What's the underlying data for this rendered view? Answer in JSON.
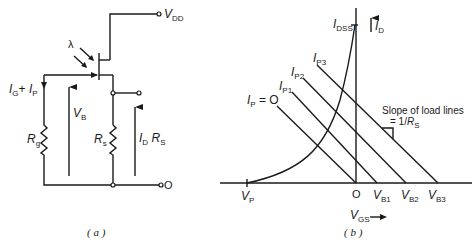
{
  "figure": {
    "panel_a": {
      "caption": "( a )",
      "labels": {
        "vdd": {
          "main": "V",
          "sub": "DD"
        },
        "lambda": "λ",
        "gate_current": {
          "a": "I",
          "a_sub": "G",
          "plus": "+ ",
          "b": "I",
          "b_sub": "P"
        },
        "vb": {
          "main": "V",
          "sub": "B"
        },
        "rg": {
          "main": "R",
          "sub": "g"
        },
        "rs": {
          "main": "R",
          "sub": "s"
        },
        "output_voltage": {
          "a": "I",
          "a_sub": "D",
          "b": " R",
          "b_sub": "S"
        },
        "ground": "O"
      }
    },
    "panel_b": {
      "caption": "( b )",
      "labels": {
        "idss": {
          "main": "I",
          "sub": "DSS"
        },
        "id_axis": {
          "main": "I",
          "sub": "D"
        },
        "vgs_axis": {
          "main": "V",
          "sub": "GS"
        },
        "vp": {
          "main": "V",
          "sub": "P"
        },
        "origin": "O",
        "vb1": {
          "main": "V",
          "sub": "B1"
        },
        "vb2": {
          "main": "V",
          "sub": "B2"
        },
        "vb3": {
          "main": "V",
          "sub": "B3"
        },
        "ip0": {
          "main": "I",
          "sub": "P",
          "suffix": " = O"
        },
        "ip1": {
          "main": "I",
          "sub": "P1"
        },
        "ip2": {
          "main": "I",
          "sub": "P2"
        },
        "ip3": {
          "main": "I",
          "sub": "P3"
        },
        "slope_note_line1": "Slope of load lines",
        "slope_note_line2": "= 1/",
        "slope_note_r": {
          "main": "R",
          "sub": "S"
        }
      }
    }
  }
}
